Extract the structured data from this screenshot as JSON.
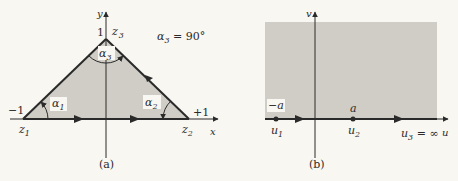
{
  "panel_a": {
    "caption": "(a)",
    "y_axis_label": "y",
    "x_axis_label": "x",
    "apex_value": "1",
    "apex_point": "z",
    "apex_point_sub": "3",
    "left_value": "−1",
    "left_point": "z",
    "left_point_sub": "1",
    "right_value": "+1",
    "right_point": "z",
    "right_point_sub": "2",
    "angle_1": "α",
    "angle_1_sub": "1",
    "angle_2": "α",
    "angle_2_sub": "2",
    "angle_3": "α",
    "angle_3_sub": "3",
    "annotation": "α",
    "annotation_sub": "3",
    "annotation_value": " = 90°"
  },
  "panel_b": {
    "caption": "(b)",
    "v_axis_label": "v",
    "u_axis_label": "u",
    "point_1_value": "−a",
    "point_1_label": "u",
    "point_1_sub": "1",
    "point_2_value": "a",
    "point_2_label": "u",
    "point_2_sub": "2",
    "point_3_label": "u",
    "point_3_sub": "3",
    "point_3_value": " = ∞"
  },
  "colors": {
    "fill": "#cfcdc6",
    "stroke": "#2a2a2a",
    "background": "#f8f7f2"
  }
}
